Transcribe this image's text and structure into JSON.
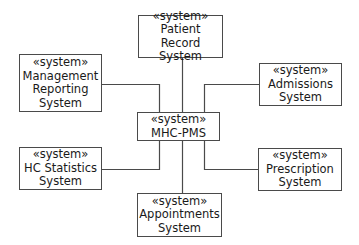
{
  "diagram": {
    "type": "UML system context diagram",
    "stereotype": "«system»",
    "center": {
      "id": "mhc-pms",
      "name": "MHC-PMS"
    },
    "nodes": [
      {
        "id": "patient-record",
        "name": "Patient Record\nSystem"
      },
      {
        "id": "management-reporting",
        "name": "Management\nReporting\nSystem"
      },
      {
        "id": "admissions",
        "name": "Admissions\nSystem"
      },
      {
        "id": "hc-statistics",
        "name": "HC Statistics\nSystem"
      },
      {
        "id": "prescription",
        "name": "Prescription\nSystem"
      },
      {
        "id": "appointments",
        "name": "Appointments\nSystem"
      }
    ],
    "edges": [
      [
        "mhc-pms",
        "patient-record"
      ],
      [
        "mhc-pms",
        "management-reporting"
      ],
      [
        "mhc-pms",
        "admissions"
      ],
      [
        "mhc-pms",
        "hc-statistics"
      ],
      [
        "mhc-pms",
        "prescription"
      ],
      [
        "mhc-pms",
        "appointments"
      ]
    ],
    "colors": {
      "stroke": "#4a4a4a",
      "text": "#1a1a1a",
      "background": "#ffffff"
    }
  }
}
